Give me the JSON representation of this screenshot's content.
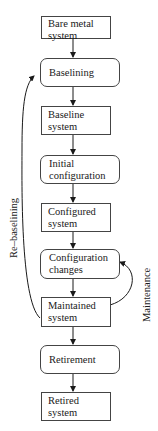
{
  "diagram": {
    "nodes": [
      {
        "id": "bare-metal-system",
        "type": "state",
        "label": "Bare metal\nsystem"
      },
      {
        "id": "baselining",
        "type": "process",
        "label": "Baselining"
      },
      {
        "id": "baseline-system",
        "type": "state",
        "label": "Baseline\nsystem"
      },
      {
        "id": "initial-configuration",
        "type": "process",
        "label": "Initial\nconfiguration"
      },
      {
        "id": "configured-system",
        "type": "state",
        "label": "Configured\nsystem"
      },
      {
        "id": "configuration-changes",
        "type": "process",
        "label": "Configuration\nchanges"
      },
      {
        "id": "maintained-system",
        "type": "state",
        "label": "Maintained\nsystem"
      },
      {
        "id": "retirement",
        "type": "process",
        "label": "Retirement"
      },
      {
        "id": "retired-system",
        "type": "state",
        "label": "Retired\nsystem"
      }
    ],
    "edges": [
      {
        "from": "bare-metal-system",
        "to": "baselining"
      },
      {
        "from": "baselining",
        "to": "baseline-system"
      },
      {
        "from": "baseline-system",
        "to": "initial-configuration"
      },
      {
        "from": "initial-configuration",
        "to": "configured-system"
      },
      {
        "from": "configured-system",
        "to": "configuration-changes"
      },
      {
        "from": "configuration-changes",
        "to": "maintained-system"
      },
      {
        "from": "maintained-system",
        "to": "retirement"
      },
      {
        "from": "retirement",
        "to": "retired-system"
      },
      {
        "from": "maintained-system",
        "to": "baselining",
        "label": "Re–baselining"
      },
      {
        "from": "maintained-system",
        "to": "configuration-changes",
        "label": "Maintenance"
      }
    ],
    "loop_labels": {
      "rebaselining": "Re–baselining",
      "maintenance": "Maintenance"
    }
  }
}
